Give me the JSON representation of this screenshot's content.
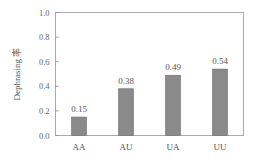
{
  "chart_data": {
    "type": "bar",
    "title": "",
    "xlabel": "",
    "ylabel": "Dephrasing 率",
    "categories": [
      "AA",
      "AU",
      "UA",
      "UU"
    ],
    "values": [
      0.15,
      0.38,
      0.49,
      0.54
    ],
    "value_labels": [
      "0.15",
      "0.38",
      "0.49",
      "0.54"
    ],
    "ylim": [
      0.0,
      1.0
    ],
    "yticks": [
      "0.0",
      "0.2",
      "0.4",
      "0.6",
      "0.8",
      "1.0"
    ],
    "grid": false,
    "legend": null,
    "bar_color": "#8a8a8a"
  }
}
